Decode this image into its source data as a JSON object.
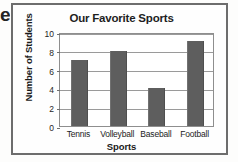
{
  "page": {
    "bleed_glyph": "e"
  },
  "chart_data": {
    "type": "bar",
    "title": "Our Favorite Sports",
    "xlabel": "Sports",
    "ylabel": "Number of Students",
    "categories": [
      "Tennis",
      "Volleyball",
      "Baseball",
      "Football"
    ],
    "values": [
      7,
      8,
      4,
      9
    ],
    "ylim": [
      0,
      10
    ],
    "ytick_step": 2,
    "ytick_labels": [
      "0",
      "2",
      "4",
      "6",
      "8",
      "10"
    ],
    "grid": true,
    "legend": false,
    "colors": {
      "bar": "#5e5e5e",
      "frame": "#6d6d6d",
      "plot_border": "#8e8e8e",
      "gridline": "#9a9a9a",
      "text": "#1e1e1e",
      "background": "#ffffff"
    }
  }
}
